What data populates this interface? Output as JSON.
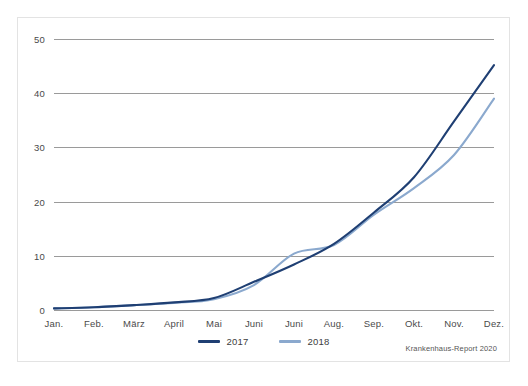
{
  "card": {
    "border_color": "#e3e3e3",
    "background": "#ffffff"
  },
  "source_note": "Krankenhaus-Report 2020",
  "legend": {
    "position": "bottom-center",
    "items": [
      {
        "label": "2017",
        "color": "#1f3f73"
      },
      {
        "label": "2018",
        "color": "#8ba9ce"
      }
    ]
  },
  "chart_data": {
    "type": "line",
    "title": "",
    "subtitle": "",
    "xlabel": "",
    "ylabel": "",
    "categories": [
      "Jan.",
      "Feb.",
      "März",
      "April",
      "Mai",
      "Juni",
      "Juni",
      "Aug.",
      "Sep.",
      "Okt.",
      "Nov.",
      "Dez."
    ],
    "yticks": [
      0,
      10,
      20,
      30,
      40,
      50
    ],
    "ylim": [
      0,
      50
    ],
    "grid": true,
    "series": [
      {
        "name": "2017",
        "color": "#1f3f73",
        "values": [
          0.3,
          0.5,
          0.9,
          1.4,
          2.2,
          5.2,
          8.4,
          12.2,
          18.0,
          24.5,
          34.8,
          45.2
        ]
      },
      {
        "name": "2018",
        "color": "#8ba9ce",
        "values": [
          0.3,
          0.5,
          0.9,
          1.3,
          2.0,
          4.6,
          10.4,
          12.0,
          17.6,
          22.5,
          28.6,
          39.0
        ]
      }
    ],
    "annotations": []
  }
}
